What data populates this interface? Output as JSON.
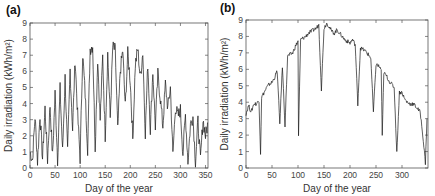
{
  "figure": {
    "panels": [
      {
        "label": "(a)"
      },
      {
        "label": "(b)"
      }
    ]
  },
  "chart_data": [
    {
      "type": "line",
      "panel": "(a)",
      "title": "",
      "xlabel": "Day of the year",
      "ylabel": "Daily irradiation (kWh/m²)",
      "xlim": [
        0,
        355
      ],
      "ylim": [
        0,
        9
      ],
      "xticks": [
        0,
        50,
        100,
        150,
        200,
        250,
        300,
        350
      ],
      "yticks": [
        0,
        1,
        2,
        3,
        4,
        5,
        6,
        7,
        8,
        9
      ],
      "grid": false,
      "series": [
        {
          "name": "Daily irradiation",
          "x": [
            0,
            5,
            10,
            15,
            20,
            25,
            30,
            35,
            40,
            45,
            50,
            55,
            60,
            65,
            70,
            75,
            80,
            85,
            90,
            95,
            100,
            105,
            110,
            115,
            120,
            125,
            130,
            135,
            140,
            145,
            150,
            155,
            160,
            165,
            170,
            175,
            180,
            185,
            190,
            195,
            200,
            205,
            210,
            215,
            220,
            225,
            230,
            235,
            240,
            245,
            250,
            255,
            260,
            265,
            270,
            275,
            280,
            285,
            290,
            295,
            300,
            305,
            310,
            315,
            320,
            325,
            330,
            335,
            340,
            345,
            350,
            355
          ],
          "values": [
            1.0,
            0.5,
            3.2,
            0.4,
            3.3,
            0.6,
            3.7,
            0.5,
            3.9,
            0.7,
            4.6,
            0.5,
            4.9,
            1.0,
            5.6,
            0.9,
            6.1,
            2.4,
            6.8,
            3.3,
            0.6,
            7.1,
            4.6,
            1.2,
            7.4,
            7.6,
            1.3,
            6.8,
            3.0,
            6.9,
            2.0,
            7.1,
            3.1,
            7.5,
            7.3,
            2.3,
            6.0,
            7.3,
            3.8,
            7.1,
            5.4,
            1.8,
            6.4,
            7.4,
            5.6,
            7.2,
            2.2,
            6.5,
            2.4,
            6.0,
            2.6,
            5.8,
            4.3,
            2.6,
            5.2,
            3.7,
            5.0,
            0.8,
            3.8,
            3.2,
            3.6,
            0.9,
            3.3,
            0.4,
            2.7,
            3.2,
            0.4,
            2.9,
            0.5,
            3.0,
            2.0,
            2.8
          ]
        }
      ]
    },
    {
      "type": "line",
      "panel": "(b)",
      "title": "",
      "xlabel": "Day of the year",
      "ylabel": "Daily irradiation (kWh/m²)",
      "xlim": [
        0,
        350
      ],
      "ylim": [
        0,
        9
      ],
      "xticks": [
        0,
        50,
        100,
        150,
        200,
        250,
        300
      ],
      "yticks": [
        0,
        1,
        2,
        3,
        4,
        5,
        6,
        7,
        8,
        9
      ],
      "grid": false,
      "series": [
        {
          "name": "Daily irradiation",
          "x": [
            0,
            5,
            10,
            15,
            20,
            25,
            28,
            30,
            35,
            40,
            45,
            50,
            55,
            60,
            65,
            70,
            75,
            80,
            85,
            90,
            95,
            100,
            101,
            105,
            110,
            115,
            120,
            125,
            130,
            135,
            140,
            145,
            150,
            155,
            158,
            160,
            165,
            170,
            175,
            180,
            185,
            190,
            195,
            200,
            205,
            210,
            215,
            220,
            225,
            230,
            235,
            240,
            245,
            250,
            255,
            260,
            262,
            265,
            270,
            275,
            280,
            285,
            290,
            295,
            300,
            305,
            310,
            315,
            320,
            325,
            330,
            335,
            340,
            345,
            348
          ],
          "values": [
            3.3,
            3.8,
            3.4,
            3.9,
            3.9,
            4.1,
            0.9,
            4.3,
            4.6,
            4.9,
            5.1,
            5.2,
            5.5,
            5.9,
            2.7,
            6.2,
            2.6,
            6.8,
            6.9,
            7.0,
            7.4,
            7.7,
            2.0,
            7.8,
            7.9,
            8.0,
            8.2,
            8.3,
            8.4,
            8.5,
            8.7,
            4.8,
            8.5,
            8.8,
            8.7,
            8.6,
            8.3,
            8.2,
            8.4,
            8.2,
            8.0,
            7.8,
            7.7,
            7.6,
            7.8,
            7.5,
            3.9,
            7.3,
            7.2,
            7.1,
            6.9,
            6.7,
            3.4,
            6.3,
            6.2,
            6.0,
            1.9,
            5.8,
            5.6,
            5.3,
            5.1,
            4.9,
            0.9,
            4.6,
            4.6,
            4.2,
            4.0,
            3.9,
            3.9,
            3.8,
            3.6,
            3.4,
            2.0,
            0.3,
            3.0
          ]
        }
      ]
    }
  ]
}
